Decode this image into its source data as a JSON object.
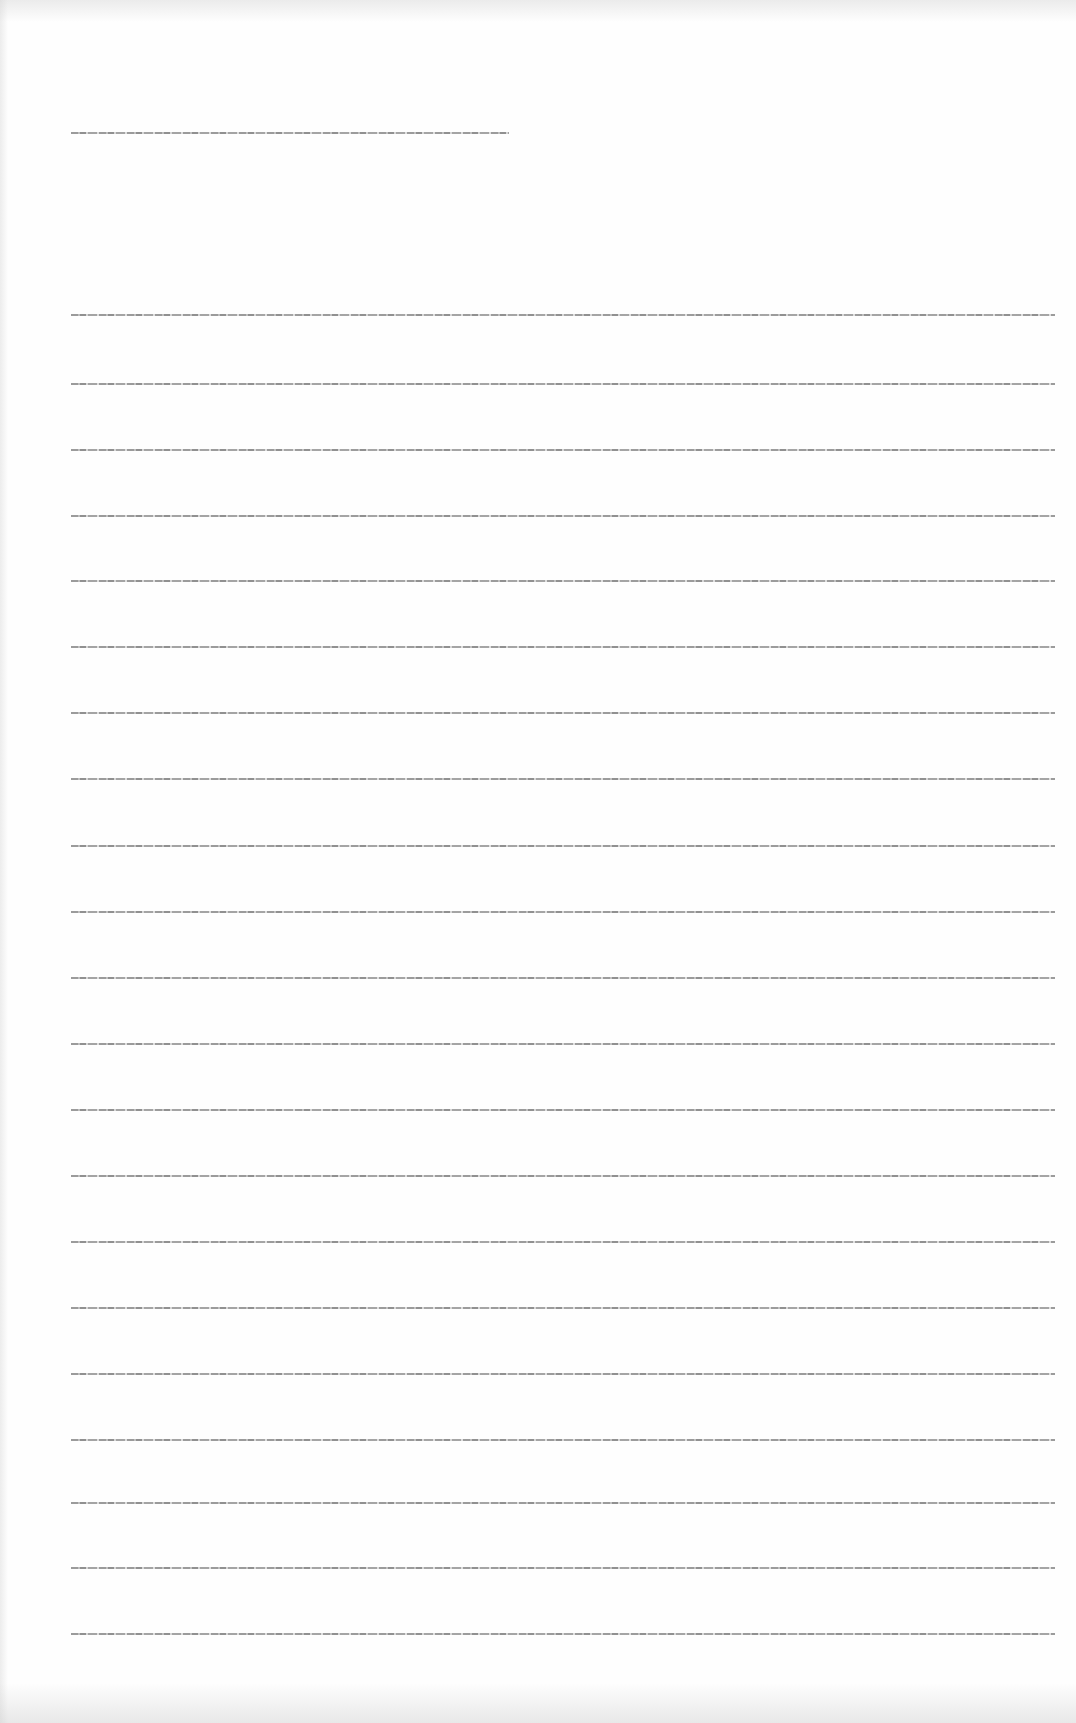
{
  "document": {
    "type": "scanned-page",
    "legibility": "illegible",
    "header_line": {
      "text": "[illegible]"
    },
    "body_lines": [
      {
        "text": "[illegible]"
      },
      {
        "text": "[illegible]"
      },
      {
        "text": "[illegible]"
      },
      {
        "text": "[illegible]"
      },
      {
        "text": "[illegible]"
      },
      {
        "text": "[illegible]"
      },
      {
        "text": "[illegible]"
      },
      {
        "text": "[illegible]"
      },
      {
        "text": "[illegible]"
      },
      {
        "text": "[illegible]"
      },
      {
        "text": "[illegible]"
      },
      {
        "text": "[illegible]"
      },
      {
        "text": "[illegible]"
      },
      {
        "text": "[illegible]"
      },
      {
        "text": "[illegible]"
      },
      {
        "text": "[illegible]"
      },
      {
        "text": "[illegible]"
      },
      {
        "text": "[illegible]"
      },
      {
        "text": "[illegible]"
      },
      {
        "text": "[illegible]"
      },
      {
        "text": "[illegible]"
      }
    ]
  },
  "colors": {
    "page_background": "#fefefe",
    "text_gray": "#8a8a8a"
  }
}
